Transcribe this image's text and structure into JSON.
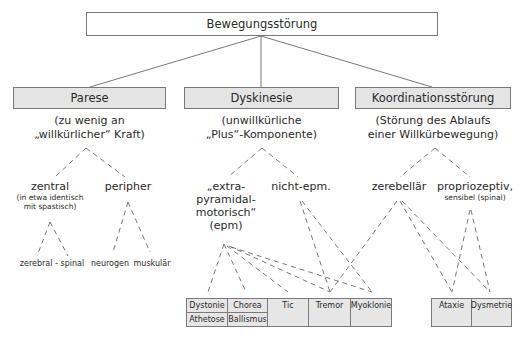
{
  "root": {
    "label": "Bewegungsstörung"
  },
  "categories": [
    {
      "label": "Parese",
      "description": [
        "(zu wenig an",
        "„willkürlicher“ Kraft)"
      ]
    },
    {
      "label": "Dyskinesie",
      "description": [
        "(unwillkürliche",
        "„Plus“-Komponente)"
      ]
    },
    {
      "label": "Koordinationsstörung",
      "description": [
        "(Störung des Ablaufs",
        "einer Willkürbewegung)"
      ]
    }
  ],
  "parese": {
    "zentral": {
      "label": "zentral",
      "note": [
        "(in etwa identisch",
        "mit spastisch)"
      ],
      "children": "zerebral - spinal"
    },
    "peripher": {
      "label": "peripher",
      "children": [
        "neurogen",
        "muskulär"
      ]
    }
  },
  "dyskinesie": {
    "epm": {
      "lines": [
        "„extra-",
        "pyramidal-",
        "motorisch“",
        "(epm)"
      ]
    },
    "nicht_epm": {
      "label": "nicht-epm."
    }
  },
  "koordination": {
    "zerebellaer": {
      "label": "zerebellär"
    },
    "propriozeptiv": {
      "label": "propriozeptiv,",
      "note": "sensibel (spinal)"
    }
  },
  "symptom_table": {
    "cells": {
      "dystonie": "Dystonie",
      "chorea": "Chorea",
      "athetose": "Athetose",
      "ballismus": "Ballismus",
      "tic": "Tic",
      "tremor": "Tremor",
      "myoklonie": "Myoklonie"
    }
  },
  "coordination_table": {
    "cells": {
      "ataxie": "Ataxie",
      "dysmetrie": "Dysmetrie"
    }
  },
  "colors": {
    "box_fill": "#e4e4e4",
    "border": "#7a7a7a",
    "line": "#555555",
    "text": "#2a2a2a"
  }
}
